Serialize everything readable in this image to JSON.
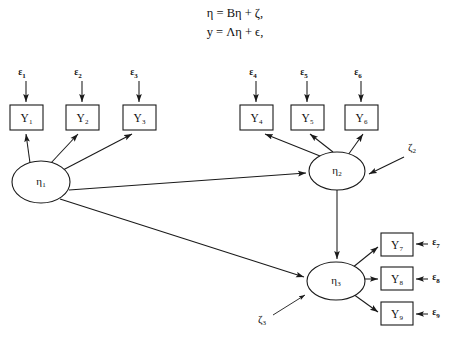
{
  "figure": {
    "type": "path-diagram",
    "title": "",
    "equations": [
      "η = Bη + ζ,",
      "y = Λη + ϵ,"
    ],
    "background_color": "#ffffff",
    "stroke_color": "#1a1a1a"
  },
  "latent_variables": [
    {
      "id": "eta1",
      "label": "η",
      "subscript": "1",
      "cx": 41,
      "cy": 182,
      "rx": 29,
      "ry": 21
    },
    {
      "id": "eta2",
      "label": "η",
      "subscript": "2",
      "cx": 337,
      "cy": 171,
      "rx": 28,
      "ry": 19
    },
    {
      "id": "eta3",
      "label": "η",
      "subscript": "3",
      "cx": 336,
      "cy": 281,
      "rx": 29,
      "ry": 19
    }
  ],
  "indicators": [
    {
      "id": "Y1",
      "label": "Y",
      "subscript": "1",
      "x": 10,
      "y": 105,
      "w": 33,
      "h": 25
    },
    {
      "id": "Y2",
      "label": "Y",
      "subscript": "2",
      "x": 66,
      "y": 105,
      "w": 33,
      "h": 25
    },
    {
      "id": "Y3",
      "label": "Y",
      "subscript": "3",
      "x": 123,
      "y": 105,
      "w": 33,
      "h": 25
    },
    {
      "id": "Y4",
      "label": "Y",
      "subscript": "4",
      "x": 240,
      "y": 105,
      "w": 33,
      "h": 25
    },
    {
      "id": "Y5",
      "label": "Y",
      "subscript": "5",
      "x": 291,
      "y": 105,
      "w": 33,
      "h": 25
    },
    {
      "id": "Y6",
      "label": "Y",
      "subscript": "6",
      "x": 345,
      "y": 105,
      "w": 33,
      "h": 25
    },
    {
      "id": "Y7",
      "label": "Y",
      "subscript": "7",
      "x": 381,
      "y": 233,
      "w": 32,
      "h": 23
    },
    {
      "id": "Y8",
      "label": "Y",
      "subscript": "8",
      "x": 381,
      "y": 267,
      "w": 32,
      "h": 23
    },
    {
      "id": "Y9",
      "label": "Y",
      "subscript": "9",
      "x": 381,
      "y": 302,
      "w": 32,
      "h": 23
    }
  ],
  "error_terms": [
    {
      "id": "e1",
      "label": "ε",
      "subscript": "1",
      "x": 22,
      "y": 73
    },
    {
      "id": "e2",
      "label": "ε",
      "subscript": "2",
      "x": 78,
      "y": 73
    },
    {
      "id": "e3",
      "label": "ε",
      "subscript": "3",
      "x": 134,
      "y": 73
    },
    {
      "id": "e4",
      "label": "ε",
      "subscript": "4",
      "x": 253,
      "y": 73
    },
    {
      "id": "e5",
      "label": "ε",
      "subscript": "5",
      "x": 304,
      "y": 73
    },
    {
      "id": "e6",
      "label": "ε",
      "subscript": "6",
      "x": 358,
      "y": 73
    },
    {
      "id": "e7",
      "label": "ε",
      "subscript": "7",
      "x": 436,
      "y": 243
    },
    {
      "id": "e8",
      "label": "ε",
      "subscript": "8",
      "x": 436,
      "y": 278
    },
    {
      "id": "e9",
      "label": "ε",
      "subscript": "9",
      "x": 436,
      "y": 313
    }
  ],
  "disturbances": [
    {
      "id": "z2",
      "label": "ζ",
      "subscript": "2",
      "x": 412,
      "y": 148
    },
    {
      "id": "z3",
      "label": "ζ",
      "subscript": "3",
      "x": 262,
      "y": 320
    }
  ],
  "edges": [
    {
      "from": "eta1",
      "to": "Y1",
      "kind": "loading"
    },
    {
      "from": "eta1",
      "to": "Y2",
      "kind": "loading"
    },
    {
      "from": "eta1",
      "to": "Y3",
      "kind": "loading"
    },
    {
      "from": "eta2",
      "to": "Y4",
      "kind": "loading"
    },
    {
      "from": "eta2",
      "to": "Y5",
      "kind": "loading"
    },
    {
      "from": "eta2",
      "to": "Y6",
      "kind": "loading"
    },
    {
      "from": "eta3",
      "to": "Y7",
      "kind": "loading"
    },
    {
      "from": "eta3",
      "to": "Y8",
      "kind": "loading"
    },
    {
      "from": "eta3",
      "to": "Y9",
      "kind": "loading"
    },
    {
      "from": "eta1",
      "to": "eta2",
      "kind": "structural"
    },
    {
      "from": "eta1",
      "to": "eta3",
      "kind": "structural"
    },
    {
      "from": "eta2",
      "to": "eta3",
      "kind": "structural"
    },
    {
      "from": "e1",
      "to": "Y1",
      "kind": "error"
    },
    {
      "from": "e2",
      "to": "Y2",
      "kind": "error"
    },
    {
      "from": "e3",
      "to": "Y3",
      "kind": "error"
    },
    {
      "from": "e4",
      "to": "Y4",
      "kind": "error"
    },
    {
      "from": "e5",
      "to": "Y5",
      "kind": "error"
    },
    {
      "from": "e6",
      "to": "Y6",
      "kind": "error"
    },
    {
      "from": "e7",
      "to": "Y7",
      "kind": "error"
    },
    {
      "from": "e8",
      "to": "Y8",
      "kind": "error"
    },
    {
      "from": "e9",
      "to": "Y9",
      "kind": "error"
    },
    {
      "from": "z2",
      "to": "eta2",
      "kind": "disturbance"
    },
    {
      "from": "z3",
      "to": "eta3",
      "kind": "disturbance"
    }
  ]
}
